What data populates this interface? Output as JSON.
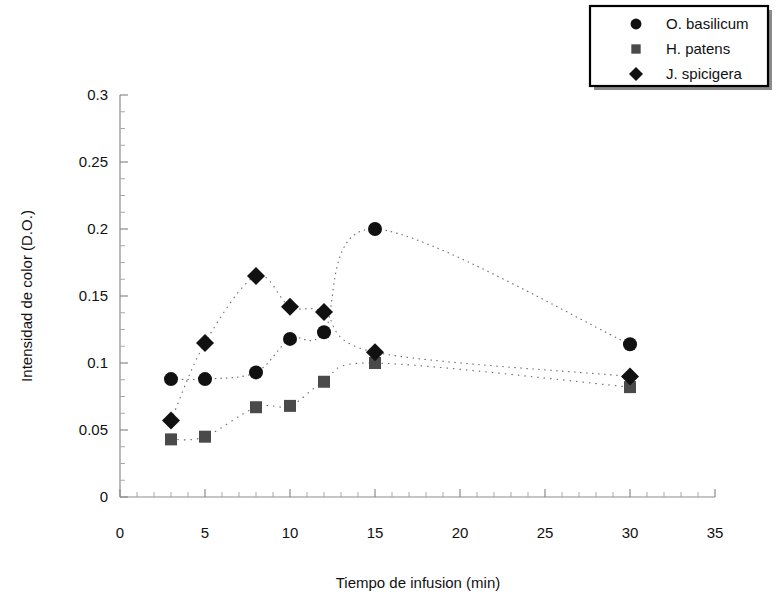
{
  "chart_data": {
    "type": "scatter",
    "title": "",
    "xlabel": "Tiempo de infusion (min)",
    "ylabel": "Intensidad de color (D.O.)",
    "xlim": [
      0,
      35
    ],
    "ylim": [
      0,
      0.3
    ],
    "xticks": [
      0,
      5,
      10,
      15,
      20,
      25,
      30,
      35
    ],
    "xtick_labels": [
      "0",
      "5",
      "10",
      "15",
      "20",
      "25",
      "30",
      "35"
    ],
    "yticks": [
      0,
      0.05,
      0.1,
      0.15,
      0.2,
      0.25,
      0.3
    ],
    "ytick_labels": [
      "0",
      "0.05",
      "0.1",
      "0.15",
      "0.2",
      "0.25",
      "0.3"
    ],
    "x_minor_tick_step": 1,
    "y_minor_tick_step": 0.0125,
    "grid": false,
    "legend_position": "top-right",
    "line_style": "dotted-smooth",
    "series": [
      {
        "name": "O. basilicum",
        "marker": "circle",
        "color": "#111111",
        "x": [
          3,
          5,
          8,
          10,
          12,
          15,
          30
        ],
        "values": [
          0.088,
          0.088,
          0.093,
          0.118,
          0.123,
          0.2,
          0.114
        ]
      },
      {
        "name": "H. patens",
        "marker": "square",
        "color": "#4a4a4a",
        "x": [
          3,
          5,
          8,
          10,
          12,
          15,
          30
        ],
        "values": [
          0.043,
          0.045,
          0.067,
          0.068,
          0.086,
          0.1,
          0.082
        ]
      },
      {
        "name": "J. spicigera",
        "marker": "diamond",
        "color": "#111111",
        "x": [
          3,
          5,
          8,
          10,
          12,
          15,
          30
        ],
        "values": [
          0.057,
          0.115,
          0.165,
          0.142,
          0.138,
          0.108,
          0.09
        ]
      }
    ]
  },
  "legend": {
    "entries": [
      {
        "label": "O. basilicum",
        "marker": "circle"
      },
      {
        "label": "H. patens",
        "marker": "square"
      },
      {
        "label": "J. spicigera",
        "marker": "diamond"
      }
    ]
  },
  "axes": {
    "x_title": "Tiempo de infusion (min)",
    "y_title": "Intensidad de color (D.O.)"
  }
}
